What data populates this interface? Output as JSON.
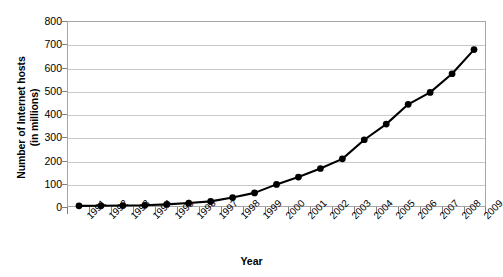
{
  "chart_data": {
    "type": "line",
    "title": "",
    "xlabel": "Year",
    "ylabel": "Number of Internet hosts\n(in millions)",
    "ylim": [
      0,
      800
    ],
    "ytick_step": 100,
    "grid": true,
    "legend": "none",
    "marker": "filled-circle",
    "line_color": "#000000",
    "marker_color": "#000000",
    "grid_color": "#c9c9c9",
    "plot_border_color": "#a6a6a6",
    "background_color": "#ffffff",
    "categories": [
      "1991",
      "1992",
      "1993",
      "1994",
      "1995",
      "1996",
      "1997",
      "1998",
      "1999",
      "2000",
      "2001",
      "2002",
      "2003",
      "2004",
      "2005",
      "2006",
      "2007",
      "2008",
      "2009"
    ],
    "values": [
      0.6,
      1,
      2,
      3,
      7,
      13,
      20,
      37,
      57,
      94,
      126,
      163,
      205,
      288,
      356,
      442,
      494,
      575,
      680
    ],
    "ytick_labels": [
      "800",
      "700",
      "600",
      "500",
      "400",
      "300",
      "200",
      "100",
      "0"
    ],
    "ytick_values": [
      800,
      700,
      600,
      500,
      400,
      300,
      200,
      100,
      0
    ]
  }
}
